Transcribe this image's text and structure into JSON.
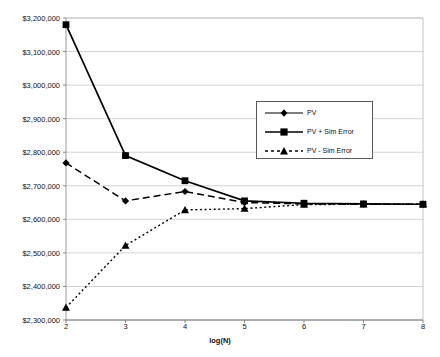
{
  "chart_data": {
    "type": "line",
    "title": "",
    "xlabel": "log(N)",
    "ylabel": "Value",
    "x": [
      2,
      3,
      4,
      5,
      6,
      7,
      8
    ],
    "xlim": [
      2,
      8
    ],
    "ylim": [
      2300000,
      3200000
    ],
    "ytick_labels": [
      "$2,300,000",
      "$2,400,000",
      "$2,500,000",
      "$2,600,000",
      "$2,700,000",
      "$2,800,000",
      "$2,900,000",
      "$3,000,000",
      "$3,100,000",
      "$3,200,000"
    ],
    "ytick_values": [
      2300000,
      2400000,
      2500000,
      2600000,
      2700000,
      2800000,
      2900000,
      3000000,
      3100000,
      3200000
    ],
    "xtick_labels": [
      "2",
      "3",
      "4",
      "5",
      "6",
      "7",
      "8"
    ],
    "grid": "horizontal",
    "legend_position": "center-right",
    "series": [
      {
        "name": "PV",
        "marker": "diamond",
        "line_style": "dashed",
        "color": "#000000",
        "values": [
          2768000,
          2655000,
          2683000,
          2650000,
          2646000,
          2645000,
          2645000
        ]
      },
      {
        "name": "PV + Sim Error",
        "marker": "square",
        "line_style": "solid",
        "color": "#000000",
        "values": [
          3180000,
          2790000,
          2715000,
          2655000,
          2648000,
          2646000,
          2645000
        ]
      },
      {
        "name": "PV - Sim Error",
        "marker": "triangle",
        "line_style": "dotted",
        "color": "#000000",
        "values": [
          2337000,
          2522000,
          2628000,
          2632000,
          2644000,
          2645000,
          2645000
        ]
      }
    ]
  },
  "axes": {
    "plot_left": 66,
    "plot_right": 423,
    "plot_top": 18,
    "plot_bottom": 320
  }
}
